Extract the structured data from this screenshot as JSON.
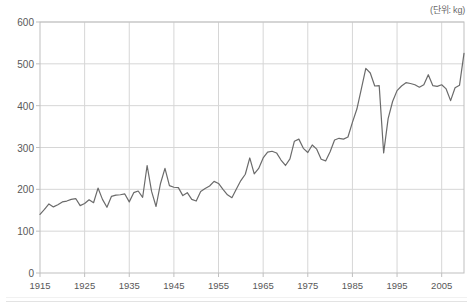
{
  "unit_label": "(단위: kg)",
  "colors": {
    "line": "#6b6b6b",
    "grid": "#d6d6d6",
    "axis": "#bfbfbf",
    "text": "#585858",
    "background": "#ffffff"
  },
  "axes": {
    "y_ticks": [
      "0",
      "100",
      "200",
      "300",
      "400",
      "500",
      "600"
    ],
    "x_ticks": [
      "1915",
      "1925",
      "1935",
      "1945",
      "1955",
      "1965",
      "1975",
      "1985",
      "1995",
      "2005"
    ]
  },
  "chart_data": {
    "type": "line",
    "title": "",
    "subtitle": "",
    "xlabel": "",
    "ylabel": "",
    "annotations": [
      "(단위: kg)"
    ],
    "legend": [],
    "legend_position": "none",
    "grid": true,
    "xlim": [
      1915,
      2010
    ],
    "ylim": [
      0,
      600
    ],
    "y_ticks": [
      0,
      100,
      200,
      300,
      400,
      500,
      600
    ],
    "x_ticks": [
      1915,
      1925,
      1935,
      1945,
      1955,
      1965,
      1975,
      1985,
      1995,
      2005
    ],
    "series": [
      {
        "name": "",
        "unit": "kg",
        "x": [
          1915,
          1916,
          1917,
          1918,
          1919,
          1920,
          1921,
          1922,
          1923,
          1924,
          1925,
          1926,
          1927,
          1928,
          1929,
          1930,
          1931,
          1932,
          1933,
          1934,
          1935,
          1936,
          1937,
          1938,
          1939,
          1940,
          1941,
          1942,
          1943,
          1944,
          1945,
          1946,
          1947,
          1948,
          1949,
          1950,
          1951,
          1952,
          1953,
          1954,
          1955,
          1956,
          1957,
          1958,
          1959,
          1960,
          1961,
          1962,
          1963,
          1964,
          1965,
          1966,
          1967,
          1968,
          1969,
          1970,
          1971,
          1972,
          1973,
          1974,
          1975,
          1976,
          1977,
          1978,
          1979,
          1980,
          1981,
          1982,
          1983,
          1984,
          1985,
          1986,
          1987,
          1988,
          1989,
          1990,
          1991,
          1992,
          1993,
          1994,
          1995,
          1996,
          1997,
          1998,
          1999,
          2000,
          2001,
          2002,
          2003,
          2004,
          2005,
          2006,
          2007,
          2008,
          2009,
          2010
        ],
        "values": [
          140,
          152,
          165,
          158,
          163,
          170,
          172,
          176,
          178,
          161,
          166,
          175,
          168,
          203,
          176,
          157,
          183,
          186,
          187,
          189,
          170,
          192,
          196,
          181,
          257,
          195,
          159,
          214,
          250,
          209,
          205,
          204,
          185,
          192,
          176,
          172,
          195,
          202,
          208,
          219,
          214,
          200,
          187,
          180,
          201,
          221,
          236,
          275,
          237,
          250,
          275,
          289,
          291,
          287,
          270,
          257,
          273,
          315,
          320,
          298,
          288,
          306,
          296,
          272,
          268,
          290,
          318,
          322,
          320,
          325,
          360,
          392,
          440,
          489,
          478,
          447,
          448,
          287,
          369,
          410,
          436,
          447,
          455,
          453,
          450,
          444,
          450,
          474,
          448,
          446,
          450,
          440,
          412,
          443,
          449,
          525
        ]
      }
    ]
  }
}
